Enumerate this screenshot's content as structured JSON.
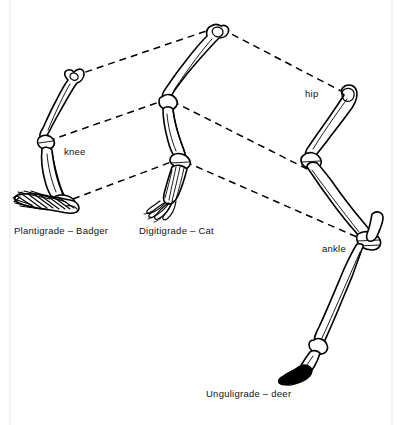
{
  "figure": {
    "background_color": "#ffffff",
    "ink_color": "#000000"
  },
  "captions": [
    {
      "id": "plantigrade",
      "text": "Plantigrade – Badger",
      "x": 14,
      "y": 234
    },
    {
      "id": "digitigrade",
      "text": "Digitigrade – Cat",
      "x": 139,
      "y": 234
    },
    {
      "id": "unguligrade",
      "text": "Unguligrade – deer",
      "x": 206,
      "y": 397
    }
  ],
  "annotations": [
    {
      "id": "knee",
      "text": "knee",
      "x": 64,
      "y": 155
    },
    {
      "id": "hip",
      "text": "hip",
      "x": 305,
      "y": 97
    },
    {
      "id": "ankle",
      "text": "ankle",
      "x": 322,
      "y": 252
    }
  ],
  "guides": [
    {
      "id": "hip-guide",
      "joint": "hip",
      "points": "74,76 218,27 341,91"
    },
    {
      "id": "knee-guide",
      "joint": "knee",
      "points": "48,141 168,99 311,171"
    },
    {
      "id": "ankle-guide",
      "joint": "ankle",
      "points": "73,199 179,159 366,241"
    }
  ],
  "specimens": [
    {
      "id": "badger",
      "posture": "Plantigrade",
      "animal": "Badger",
      "foot_style": "hatched-sole"
    },
    {
      "id": "cat",
      "posture": "Digitigrade",
      "animal": "Cat",
      "foot_style": "splayed-toes"
    },
    {
      "id": "deer",
      "posture": "Unguligrade",
      "animal": "deer",
      "foot_style": "solid-hoof"
    }
  ]
}
